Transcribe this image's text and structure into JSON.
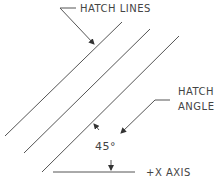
{
  "labels": {
    "hatch_lines": "HATCH LINES",
    "hatch_angle_1": "HATCH",
    "hatch_angle_2": "ANGLE",
    "angle_value": "45°",
    "x_axis": "+X AXIS"
  },
  "colors": {
    "line": "#555555",
    "text": "#444444",
    "background": "#ffffff"
  }
}
